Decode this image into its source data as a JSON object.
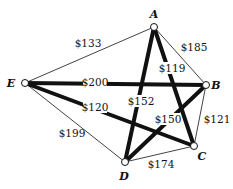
{
  "graph": {
    "type": "complete-graph-weighted",
    "nodes": [
      {
        "id": "A",
        "label": "A"
      },
      {
        "id": "B",
        "label": "B"
      },
      {
        "id": "C",
        "label": "C"
      },
      {
        "id": "D",
        "label": "D"
      },
      {
        "id": "E",
        "label": "E"
      }
    ],
    "edges": [
      {
        "from": "A",
        "to": "E",
        "weight": "$133",
        "highlighted": false
      },
      {
        "from": "A",
        "to": "B",
        "weight": "$185",
        "highlighted": false
      },
      {
        "from": "B",
        "to": "C",
        "weight": "$121",
        "highlighted": false
      },
      {
        "from": "C",
        "to": "D",
        "weight": "$174",
        "highlighted": false
      },
      {
        "from": "D",
        "to": "E",
        "weight": "$199",
        "highlighted": false
      },
      {
        "from": "E",
        "to": "B",
        "weight": "$200",
        "highlighted": true
      },
      {
        "from": "A",
        "to": "D",
        "weight": "$152",
        "highlighted": true
      },
      {
        "from": "A",
        "to": "C",
        "weight": "$119",
        "highlighted": true
      },
      {
        "from": "E",
        "to": "C",
        "weight": "$120",
        "highlighted": true
      },
      {
        "from": "B",
        "to": "D",
        "weight": "$150",
        "highlighted": true
      }
    ],
    "colors": {
      "edge": "#111111",
      "node_fill": "#ffffff",
      "node_stroke": "#111111"
    }
  }
}
